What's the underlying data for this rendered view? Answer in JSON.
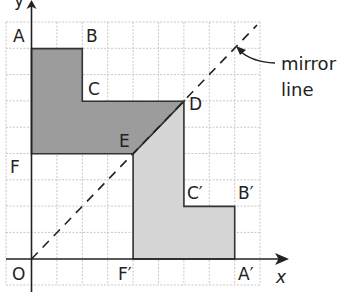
{
  "diagram": {
    "origin_px": [
      31.5,
      259
    ],
    "unit_px": 25.4,
    "grid": {
      "x_range": [
        -1,
        9
      ],
      "y_range": [
        -1,
        9
      ],
      "line_color": "#c8c8c8"
    },
    "axes": {
      "x_label": "x",
      "y_label": "y",
      "origin_label": "O"
    },
    "mirror_line": {
      "label_line1": "mirror",
      "label_line2": "line",
      "equation": "y = x"
    },
    "colors": {
      "object_fill": "#9c9c9c",
      "image_fill": "#d6d6d6",
      "outline": "#333333"
    },
    "object_shape": {
      "name": "ABCDEF",
      "vertices": [
        {
          "label": "A",
          "x": 0,
          "y": 8
        },
        {
          "label": "B",
          "x": 2,
          "y": 8
        },
        {
          "label": "C",
          "x": 2,
          "y": 6
        },
        {
          "label": "D",
          "x": 6,
          "y": 6
        },
        {
          "label": "E",
          "x": 4,
          "y": 4
        },
        {
          "label": "F",
          "x": 0,
          "y": 4
        }
      ]
    },
    "image_shape": {
      "name": "A'B'C'DEF'",
      "vertices": [
        {
          "label": "A′",
          "x": 8,
          "y": 0
        },
        {
          "label": "B′",
          "x": 8,
          "y": 2
        },
        {
          "label": "C′",
          "x": 6,
          "y": 2
        },
        {
          "label": "D",
          "x": 6,
          "y": 6
        },
        {
          "label": "E",
          "x": 4,
          "y": 4
        },
        {
          "label": "F′",
          "x": 4,
          "y": 0
        }
      ]
    },
    "labels": {
      "A": "A",
      "B": "B",
      "C": "C",
      "D": "D",
      "E": "E",
      "F": "F",
      "A_prime": "A′",
      "B_prime": "B′",
      "C_prime": "C′",
      "F_prime": "F′"
    }
  }
}
